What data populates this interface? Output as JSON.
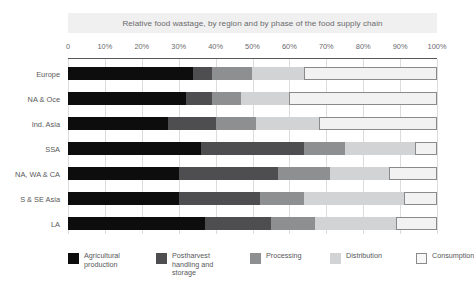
{
  "chart_data": {
    "type": "bar",
    "orientation": "horizontal",
    "stacked": true,
    "normalized": true,
    "title": "Relative food wastage, by region and by phase of the food supply chain",
    "xlabel": "",
    "ylabel": "",
    "xlim": [
      0,
      100
    ],
    "grid": true,
    "legend_position": "bottom",
    "tick_labels": [
      "0",
      "10%",
      "20%",
      "30%",
      "40%",
      "50%",
      "60%",
      "70%",
      "80%",
      "90%",
      "100%"
    ],
    "tick_values": [
      0,
      10,
      20,
      30,
      40,
      50,
      60,
      70,
      80,
      90,
      100
    ],
    "categories": [
      "Europe",
      "NA & Oce",
      "Ind. Asia",
      "SSA",
      "NA, WA & CA",
      "S & SE Asia",
      "LA"
    ],
    "series": [
      {
        "name": "Agricultural production",
        "color": "#0d0d0d",
        "values": [
          34,
          32,
          27,
          36,
          30,
          30,
          37
        ]
      },
      {
        "name": "Postharvest handling and storage",
        "color": "#4e4e50",
        "values": [
          5,
          7,
          13,
          28,
          27,
          22,
          18
        ]
      },
      {
        "name": "Processing",
        "color": "#8e8f91",
        "values": [
          11,
          8,
          11,
          11,
          14,
          12,
          12
        ]
      },
      {
        "name": "Distribution",
        "color": "#d2d3d4",
        "values": [
          14,
          13,
          17,
          19,
          16,
          27,
          22
        ]
      },
      {
        "name": "Consumption",
        "color": "#f2f2f2",
        "values": [
          36,
          40,
          32,
          6,
          13,
          9,
          11
        ]
      }
    ]
  },
  "legend": {
    "items": [
      {
        "label": "Agricultural\nproduction",
        "swatch": "#0d0d0d",
        "outlined": false
      },
      {
        "label": "Postharvest\nhandling and\nstorage",
        "swatch": "#4e4e50",
        "outlined": false
      },
      {
        "label": "Processing",
        "swatch": "#8e8f91",
        "outlined": false
      },
      {
        "label": "Distribution",
        "swatch": "#d2d3d4",
        "outlined": false
      },
      {
        "label": "Consumption",
        "swatch": "#f7f7f7",
        "outlined": true
      }
    ],
    "x_positions": [
      0,
      88,
      182,
      262,
      348
    ]
  }
}
